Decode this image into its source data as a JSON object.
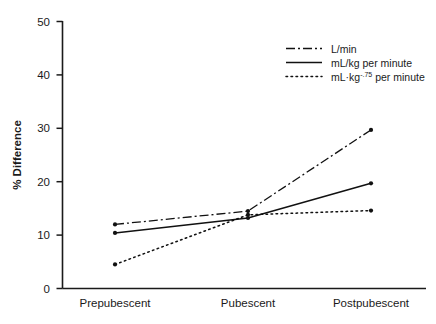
{
  "chart_data": {
    "type": "line",
    "title": "",
    "xlabel": "",
    "ylabel": "% Difference",
    "categories": [
      "Prepubescent",
      "Pubescent",
      "Postpubescent"
    ],
    "ylim": [
      0,
      50
    ],
    "yticks": [
      0,
      10,
      20,
      30,
      40,
      50
    ],
    "grid": false,
    "legend_position": "top-right",
    "series": [
      {
        "name": "L/min",
        "style": "dash-dot",
        "color": "#111111",
        "values": [
          12.0,
          14.5,
          29.7
        ]
      },
      {
        "name": "mL/kg per minute",
        "style": "solid",
        "color": "#111111",
        "values": [
          10.4,
          13.2,
          19.7
        ]
      },
      {
        "name": "mL·kg⁻·⁷⁵ per minute",
        "name_base": "mL·kg",
        "name_sup": "-.75",
        "name_tail": " per minute",
        "style": "dotted",
        "color": "#111111",
        "values": [
          4.5,
          13.8,
          14.6
        ]
      }
    ]
  },
  "axes": {
    "y_tick_labels": [
      "0",
      "10",
      "20",
      "30",
      "40",
      "50"
    ],
    "y_axis_title": "% Difference"
  },
  "legend": {
    "items": [
      {
        "label": "L/min",
        "style": "dash-dot"
      },
      {
        "label": "mL/kg per minute",
        "style": "solid"
      },
      {
        "label_base": "mL·kg",
        "label_sup": "-.75",
        "label_tail": " per minute",
        "style": "dotted"
      }
    ]
  },
  "categories": {
    "c0": "Prepubescent",
    "c1": "Pubescent",
    "c2": "Postpubescent"
  }
}
